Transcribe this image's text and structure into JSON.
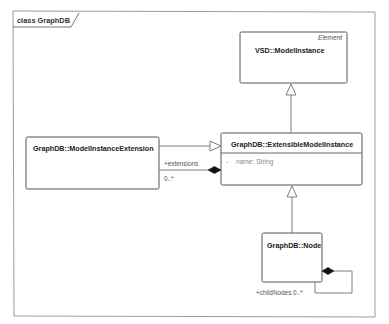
{
  "diagram": {
    "frame_title": "class GraphDB",
    "classes": [
      {
        "id": "vsd-model-instance",
        "name": "VSD::ModelInstance",
        "stereotype": "Element",
        "attributes": []
      },
      {
        "id": "model-instance-extension",
        "name": "GraphDB::ModelInstanceExtension",
        "attributes": []
      },
      {
        "id": "extensible-model-instance",
        "name": "GraphDB::ExtensibleModelInstance",
        "attributes": [
          {
            "visibility": "-",
            "text": "name: String"
          }
        ]
      },
      {
        "id": "node",
        "name": "GraphDB::Node",
        "attributes": []
      }
    ],
    "relationships": [
      {
        "type": "generalization",
        "from": "GraphDB::ExtensibleModelInstance",
        "to": "VSD::ModelInstance"
      },
      {
        "type": "generalization",
        "from": "GraphDB::ModelInstanceExtension",
        "to": "GraphDB::ExtensibleModelInstance"
      },
      {
        "type": "composition",
        "from": "GraphDB::ExtensibleModelInstance",
        "to": "GraphDB::ModelInstanceExtension",
        "role": "+extensions",
        "multiplicity": "0..*"
      },
      {
        "type": "generalization",
        "from": "GraphDB::Node",
        "to": "GraphDB::ExtensibleModelInstance"
      },
      {
        "type": "composition",
        "from": "GraphDB::Node",
        "to": "GraphDB::Node",
        "role": "+childNodes",
        "multiplicity": "0..*",
        "label": "+childNodes 0..*"
      }
    ],
    "colors": {
      "line": "#6f6f6f",
      "box_border": "#555555",
      "background": "#ffffff"
    }
  }
}
